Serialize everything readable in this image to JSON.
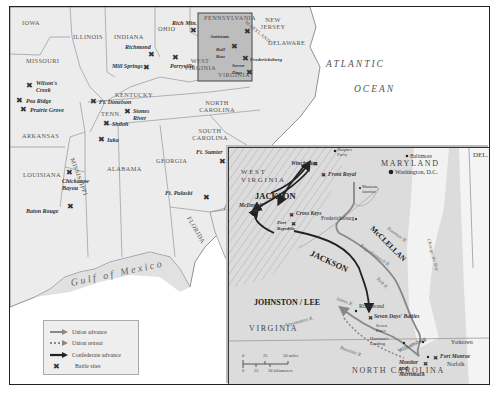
{
  "map": {
    "main": {
      "states": [
        "IOWA",
        "ILLINOIS",
        "INDIANA",
        "OHIO",
        "PENNSYLVANIA",
        "NEW JERSEY",
        "DELAWARE",
        "MISSOURI",
        "WEST VIRGINIA",
        "KENTUCKY",
        "TENN.",
        "NORTH CAROLINA",
        "ARKANSAS",
        "SOUTH CAROLINA",
        "LOUISIANA",
        "MISSISSIPPI",
        "ALABAMA",
        "GEORGIA",
        "FLORIDA",
        "VIRGINIA",
        "MARYLAND"
      ],
      "water": {
        "atlantic": "ATLANTIC",
        "ocean": "OCEAN",
        "gulf": "Gulf of Mexico"
      },
      "battles": [
        "Wilson's Creek",
        "Pea Ridge",
        "Prairie Grove",
        "Ft. Donelson",
        "Stones River",
        "Shiloh",
        "Iuka",
        "Chickasaw Bayou",
        "Baton Rouge",
        "Richmond",
        "Mill Springs",
        "Perryville",
        "Rich Mtn.",
        "Antietam",
        "Bull Run",
        "Fredericksburg",
        "Seven Days",
        "Ft. Sumter",
        "Ft. Pulaski"
      ]
    },
    "inset": {
      "states": {
        "west_virginia": "WEST VIRGINIA",
        "maryland": "MARYLAND",
        "del": "DEL.",
        "virginia": "VIRGINIA",
        "north_carolina": "NORTH CAROLINA"
      },
      "armies": {
        "jackson1": "JACKSON",
        "jackson2": "JACKSON",
        "mcclellan": "McCLELLAN",
        "johnston_lee": "JOHNSTON / LEE"
      },
      "cities": {
        "harpers_ferry": "Harpers Ferry",
        "baltimore": "Baltimore",
        "washington": "Washington, D.C.",
        "manassas": "Manassas Junction",
        "fredericksburg": "Fredericksburg",
        "richmond": "Richmond",
        "seven_pines": "Seven Pines",
        "harrisons_landing": "Harrison's Landing",
        "williamsburg": "Williamsburg",
        "yorktown": "Yorktown",
        "norfolk": "Norfolk"
      },
      "battles": {
        "winchester": "Winchester",
        "front_royal": "Front Royal",
        "mcdowell": "McDowell",
        "cross_keys": "Cross Keys",
        "port_republic": "Port Republic",
        "seven_days": "Seven Days' Battles",
        "fort_monroe": "Fort Monroe",
        "monitor": "Monitor and Merrimack"
      },
      "rivers": {
        "potomac": "Potomac R.",
        "rappahannock": "Rappahannock R.",
        "york": "York R.",
        "james": "James R.",
        "appomattox": "Appomattox R.",
        "roanoke": "Roanoke R.",
        "chesapeake": "Chesapeake Bay"
      },
      "scale": {
        "miles_0": "0",
        "miles_25": "25",
        "miles_50": "50 miles",
        "km_0": "0",
        "km_25": "25",
        "km_50": "50 kilometers"
      }
    },
    "legend": {
      "items": [
        {
          "label": "Union advance",
          "symbol": "union-advance"
        },
        {
          "label": "Union retreat",
          "symbol": "union-retreat"
        },
        {
          "label": "Confederate advance",
          "symbol": "confederate-advance"
        },
        {
          "label": "Battle sites",
          "symbol": "battle-site"
        }
      ]
    },
    "colors": {
      "union": "#888888",
      "confederate": "#222222",
      "land": "#ececec",
      "inset_land": "#d6d6d6",
      "water": "#ffffff",
      "border": "#222222"
    }
  }
}
